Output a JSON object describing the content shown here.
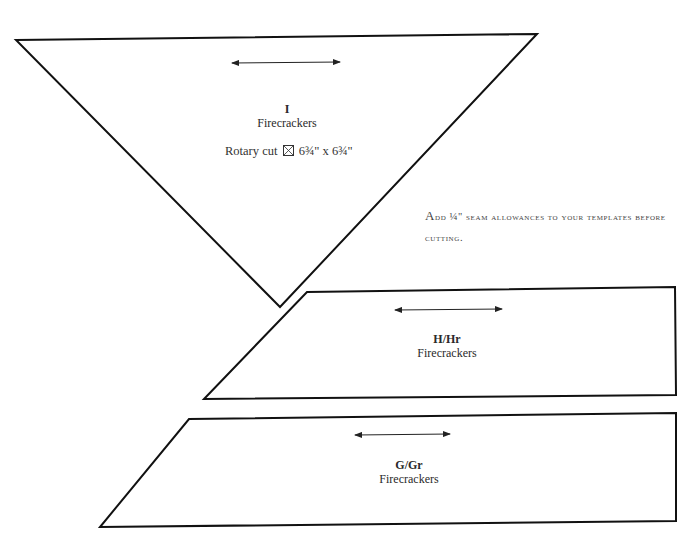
{
  "templates": [
    {
      "id": "I",
      "name": "Firecrackers",
      "rotary_cut": {
        "prefix": "Rotary cut",
        "icon": "square-cut-diagonally-icon",
        "size": "6¾\" x 6¾\""
      }
    },
    {
      "id": "H/Hr",
      "name": "Firecrackers"
    },
    {
      "id": "G/Gr",
      "name": "Firecrackers"
    }
  ],
  "note": {
    "first": "A",
    "rest": "dd ¼\" seam allowances to your templates before cutting."
  },
  "icons": {
    "grain_arrow": "double-headed-arrow-icon"
  },
  "colors": {
    "outline": "#111111",
    "text": "#2a2a2a"
  }
}
